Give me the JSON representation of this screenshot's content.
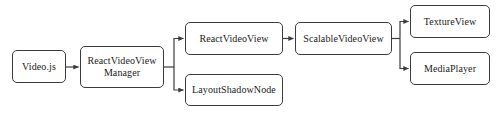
{
  "diagram": {
    "type": "flowchart",
    "background_color": "#ffffff",
    "node_border_color": "#3c3c3c",
    "node_fill_color": "#ffffff",
    "edge_color": "#3c3c3c",
    "nodes": [
      {
        "id": "videojs",
        "label": "Video.js"
      },
      {
        "id": "manager",
        "label": "ReactVideoView\nManager"
      },
      {
        "id": "rvv",
        "label": "ReactVideoView"
      },
      {
        "id": "lsn",
        "label": "LayoutShadowNode"
      },
      {
        "id": "svv",
        "label": "ScalableVideoView"
      },
      {
        "id": "texture",
        "label": "TextureView"
      },
      {
        "id": "media",
        "label": "MediaPlayer"
      }
    ],
    "edges": [
      {
        "from": "videojs",
        "to": "manager"
      },
      {
        "from": "manager",
        "to": "rvv"
      },
      {
        "from": "manager",
        "to": "lsn"
      },
      {
        "from": "rvv",
        "to": "svv"
      },
      {
        "from": "svv",
        "to": "texture"
      },
      {
        "from": "svv",
        "to": "media"
      }
    ]
  }
}
